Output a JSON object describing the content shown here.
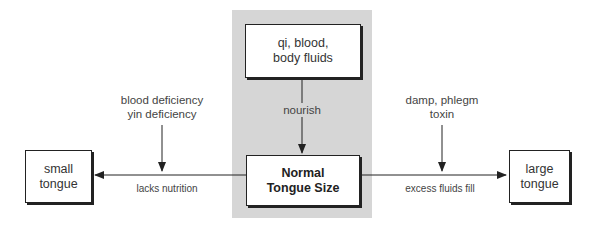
{
  "diagram": {
    "center_column": {
      "source_box": {
        "line1": "qi, blood,",
        "line2": "body fluids"
      },
      "edge_label": "nourish",
      "target_box": {
        "line1": "Normal",
        "line2": "Tongue Size"
      }
    },
    "left_branch": {
      "cause_line1": "blood deficiency",
      "cause_line2": "yin deficiency",
      "edge_label": "lacks nutrition",
      "result_box": {
        "line1": "small",
        "line2": "tongue"
      }
    },
    "right_branch": {
      "cause_line1": "damp, phlegm",
      "cause_line2": "toxin",
      "edge_label": "excess fluids fill",
      "result_box": {
        "line1": "large",
        "line2": "tongue"
      }
    },
    "colors": {
      "panel": "#d6d6d6",
      "stroke": "#222222",
      "text": "#333333"
    }
  }
}
